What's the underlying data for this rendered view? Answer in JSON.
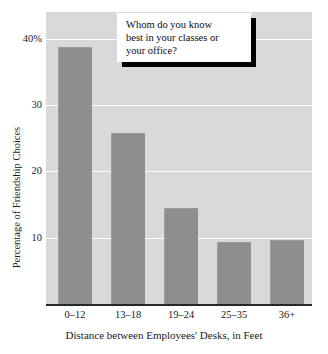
{
  "chart_data": {
    "type": "bar",
    "title": "",
    "categories": [
      "0–12",
      "13–18",
      "19–24",
      "25–35",
      "36+"
    ],
    "values": [
      38.8,
      25.7,
      14.5,
      9.4,
      9.7
    ],
    "series": [
      {
        "name": "Percentage of Friendship Choices",
        "values": [
          38.8,
          25.7,
          14.5,
          9.4,
          9.7
        ]
      }
    ],
    "xlabel": "Distance between Employees' Desks, in Feet",
    "ylabel": "Percentage of Friendship Choices",
    "ylim": [
      0,
      44
    ],
    "yticks": [
      10,
      20,
      30,
      40
    ],
    "ytick_labels": [
      "10",
      "20",
      "30",
      "40%"
    ],
    "grid": "horizontal",
    "legend": "none",
    "annotations": [
      {
        "name": "question-callout",
        "text": "Whom do you know\nbest in your classes or\nyour office?"
      }
    ],
    "colors": {
      "bar_fill": "#8e8e8e",
      "plot_background": "#d9d9d9",
      "gridline": "#ffffff",
      "axis_line": "#262626",
      "text": "#1a1a1a",
      "callout_background": "#ffffff",
      "callout_shadow": "#000000"
    }
  }
}
